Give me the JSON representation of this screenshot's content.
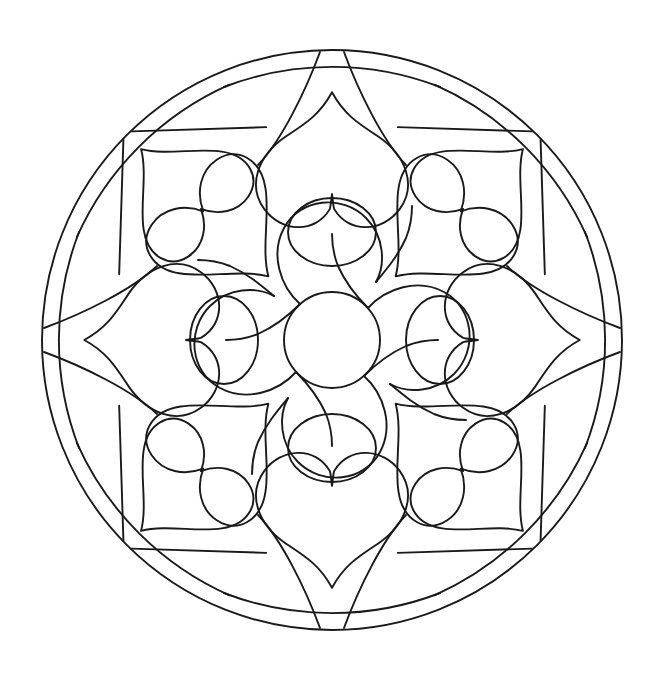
{
  "document": {
    "kind": "coloring-page",
    "title": "Mandala Coloring Page",
    "canvas": {
      "width": 670,
      "height": 675,
      "background": "#ffffff"
    },
    "line_color": "#1a1a1a",
    "line_width": 1.9,
    "fill": "none"
  },
  "geometry": {
    "center": {
      "x": 332,
      "y": 340
    },
    "outer_circle_radius": 290,
    "outer_circle_bounds": {
      "left": 42,
      "top": 33,
      "right": 622,
      "bottom": 648
    },
    "symmetry_fold": 8,
    "symmetry_step_degrees": 45,
    "mirror_axis_vertical": true
  },
  "rings": [
    {
      "name": "center-disc",
      "order": 1,
      "description": "small plain circle at the exact middle",
      "radius": 48,
      "count": 1
    },
    {
      "name": "inner-petal-ring",
      "order": 2,
      "description": "four broad rounded petals around the center disc with pointed notches between them",
      "count": 4,
      "petal_angles_degrees": [
        45,
        135,
        225,
        315
      ],
      "petal_outer_radius": 130
    },
    {
      "name": "axis-lobe-ring",
      "order": 3,
      "description": "four small oval lobes sitting on the vertical and horizontal axes just outside the center",
      "count": 4,
      "lobe_angles_degrees": [
        0,
        90,
        180,
        270
      ],
      "lobe_center_radius": 108,
      "lobe_rx": 44,
      "lobe_ry": 34
    },
    {
      "name": "middle-heart-ring",
      "order": 4,
      "description": "four large hearts on the diagonals pointing inward toward the center",
      "count": 4,
      "heart_angles_degrees": [
        45,
        135,
        225,
        315
      ],
      "heart_center_radius": 150,
      "heart_size": 105
    },
    {
      "name": "axis-bulb-ring",
      "order": 5,
      "description": "four large tulip / bulb shapes on the vertical and horizontal axes, each with a cleft notch facing the center",
      "count": 4,
      "bulb_angles_degrees": [
        0,
        90,
        180,
        270
      ],
      "bulb_center_radius": 185,
      "bulb_size": 118
    },
    {
      "name": "outer-heart-ring",
      "order": 6,
      "description": "four hearts near the rim on the diagonals, each tilted and pointing outward",
      "count": 4,
      "heart_angles_degrees": [
        45,
        135,
        225,
        315
      ],
      "heart_center_radius": 215,
      "heart_size": 95
    },
    {
      "name": "rim-spoke-ring",
      "order": 7,
      "description": "eight pairs of straight spokes radiating from the rim inward forming wedge triangles",
      "count": 8,
      "spoke_angles_degrees": [
        0,
        45,
        90,
        135,
        180,
        225,
        270,
        315
      ]
    },
    {
      "name": "rim-arc-ring",
      "order": 8,
      "description": "eight shallow chord arcs just inside the outer circle linking the spoke feet",
      "count": 8,
      "arc_chord_radius": 253
    },
    {
      "name": "outer-boundary",
      "order": 9,
      "description": "the single large enclosing circle",
      "count": 1,
      "radius": 290
    }
  ],
  "motifs": {
    "heart_count_total": 8,
    "bulb_count": 4,
    "petal_count": 4,
    "lobe_count": 4,
    "circle_count": 2
  },
  "palette": {
    "stroke": "#1a1a1a",
    "background": "#ffffff"
  }
}
